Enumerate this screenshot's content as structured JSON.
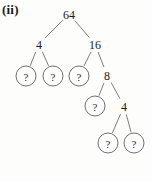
{
  "figure": {
    "label": "(ii)",
    "caption": "",
    "type": "binary-factor-tree"
  },
  "colors": {
    "background": "#fdfdfc",
    "stroke": "#6d6d6d",
    "node_stroke": "#5f5f5f",
    "text": "#1a1a1a"
  },
  "tree": {
    "unknown_symbol": "?",
    "nodes": [
      {
        "id": "n0",
        "label": "64",
        "shape": "plain",
        "cx": 69,
        "cy": 14
      },
      {
        "id": "n1",
        "label": "4",
        "shape": "plain",
        "cx": 39,
        "cy": 44
      },
      {
        "id": "n2",
        "label": "16",
        "shape": "plain",
        "cx": 95,
        "cy": 44
      },
      {
        "id": "n3",
        "label": "?",
        "shape": "circle",
        "cx": 26,
        "cy": 76
      },
      {
        "id": "n4",
        "label": "?",
        "shape": "circle",
        "cx": 53,
        "cy": 76
      },
      {
        "id": "n5",
        "label": "?",
        "shape": "circle",
        "cx": 79,
        "cy": 76
      },
      {
        "id": "n6",
        "label": "8",
        "shape": "plain",
        "cx": 107,
        "cy": 75
      },
      {
        "id": "n7",
        "label": "?",
        "shape": "circle",
        "cx": 95,
        "cy": 106
      },
      {
        "id": "n8",
        "label": "4",
        "shape": "plain",
        "cx": 124,
        "cy": 106
      },
      {
        "id": "n9",
        "label": "?",
        "shape": "circle",
        "cx": 108,
        "cy": 143
      },
      {
        "id": "n10",
        "label": "?",
        "shape": "circle",
        "cx": 134,
        "cy": 143
      }
    ],
    "edges": [
      {
        "from": "n0",
        "to": "n1"
      },
      {
        "from": "n0",
        "to": "n2"
      },
      {
        "from": "n1",
        "to": "n3"
      },
      {
        "from": "n1",
        "to": "n4"
      },
      {
        "from": "n2",
        "to": "n5"
      },
      {
        "from": "n2",
        "to": "n6"
      },
      {
        "from": "n6",
        "to": "n7"
      },
      {
        "from": "n6",
        "to": "n8"
      },
      {
        "from": "n8",
        "to": "n9"
      },
      {
        "from": "n8",
        "to": "n10"
      }
    ]
  }
}
